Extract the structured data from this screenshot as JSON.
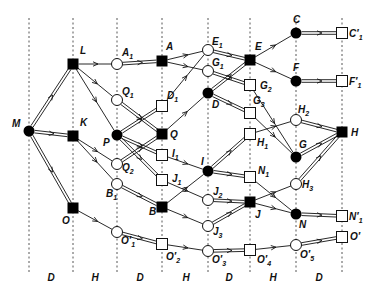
{
  "diagram": {
    "columns": [
      {
        "x": 29
      },
      {
        "x": 73
      },
      {
        "x": 117
      },
      {
        "x": 162
      },
      {
        "x": 208
      },
      {
        "x": 250
      },
      {
        "x": 296
      },
      {
        "x": 342
      }
    ],
    "bands": [
      {
        "label": "D",
        "x": 51
      },
      {
        "label": "H",
        "x": 95
      },
      {
        "label": "D",
        "x": 140
      },
      {
        "label": "H",
        "x": 186
      },
      {
        "label": "D",
        "x": 229
      },
      {
        "label": "H",
        "x": 273
      },
      {
        "label": "D",
        "x": 319
      }
    ],
    "nodes": [
      {
        "id": "M",
        "type": "filled-circle",
        "x": 29,
        "y": 131,
        "label": "M",
        "lx": 12,
        "ly": 127
      },
      {
        "id": "L",
        "type": "filled-square",
        "x": 73,
        "y": 64,
        "label": "L",
        "lx": 80,
        "ly": 54
      },
      {
        "id": "K",
        "type": "filled-square",
        "x": 73,
        "y": 136,
        "label": "K",
        "lx": 80,
        "ly": 126
      },
      {
        "id": "O",
        "type": "filled-square",
        "x": 73,
        "y": 208,
        "label": "O",
        "lx": 62,
        "ly": 224
      },
      {
        "id": "A1",
        "type": "open-circle",
        "x": 117,
        "y": 64,
        "label": "A",
        "sub": "1",
        "lx": 122,
        "ly": 56
      },
      {
        "id": "Q1",
        "type": "open-circle",
        "x": 117,
        "y": 100,
        "label": "Q",
        "sub": "1",
        "lx": 122,
        "ly": 95
      },
      {
        "id": "P",
        "type": "filled-circle",
        "x": 117,
        "y": 135,
        "label": "P",
        "lx": 103,
        "ly": 146
      },
      {
        "id": "Q2",
        "type": "open-circle",
        "x": 117,
        "y": 164,
        "label": "Q",
        "sub": "2",
        "lx": 122,
        "ly": 171
      },
      {
        "id": "B1",
        "type": "open-circle",
        "x": 117,
        "y": 184,
        "label": "B",
        "sub": "1",
        "lx": 106,
        "ly": 197
      },
      {
        "id": "O1p",
        "type": "open-circle",
        "x": 117,
        "y": 232,
        "label": "O′",
        "sub": "1",
        "lx": 121,
        "ly": 244
      },
      {
        "id": "A",
        "type": "filled-square",
        "x": 162,
        "y": 61,
        "label": "A",
        "lx": 166,
        "ly": 50
      },
      {
        "id": "D1",
        "type": "open-square",
        "x": 162,
        "y": 106,
        "label": "D",
        "sub": "1",
        "lx": 167,
        "ly": 99
      },
      {
        "id": "Q",
        "type": "filled-square",
        "x": 162,
        "y": 134,
        "label": "Q",
        "lx": 170,
        "ly": 138
      },
      {
        "id": "I1",
        "type": "open-square",
        "x": 162,
        "y": 155,
        "label": "I",
        "sub": "1",
        "lx": 172,
        "ly": 157
      },
      {
        "id": "J1",
        "type": "open-square",
        "x": 162,
        "y": 180,
        "label": "J",
        "sub": "1",
        "lx": 172,
        "ly": 182
      },
      {
        "id": "B",
        "type": "filled-square",
        "x": 162,
        "y": 207,
        "label": "B",
        "lx": 149,
        "ly": 215
      },
      {
        "id": "O2p",
        "type": "open-square",
        "x": 162,
        "y": 244,
        "label": "O′",
        "sub": "2",
        "lx": 166,
        "ly": 260
      },
      {
        "id": "E1",
        "type": "open-circle",
        "x": 208,
        "y": 50,
        "label": "E",
        "sub": "1",
        "lx": 212,
        "ly": 45
      },
      {
        "id": "G1",
        "type": "open-circle",
        "x": 208,
        "y": 71,
        "label": "G",
        "sub": "1",
        "lx": 212,
        "ly": 66
      },
      {
        "id": "D",
        "type": "filled-circle",
        "x": 208,
        "y": 93,
        "label": "D",
        "lx": 212,
        "ly": 108
      },
      {
        "id": "I",
        "type": "filled-circle",
        "x": 208,
        "y": 171,
        "label": "I",
        "lx": 201,
        "ly": 165
      },
      {
        "id": "J2",
        "type": "open-circle",
        "x": 208,
        "y": 200,
        "label": "J",
        "sub": "2",
        "lx": 213,
        "ly": 195
      },
      {
        "id": "J3",
        "type": "open-circle",
        "x": 208,
        "y": 226,
        "label": "J",
        "sub": "3",
        "lx": 213,
        "ly": 235
      },
      {
        "id": "O3p",
        "type": "open-circle",
        "x": 208,
        "y": 251,
        "label": "O′",
        "sub": "3",
        "lx": 212,
        "ly": 263
      },
      {
        "id": "E",
        "type": "filled-square",
        "x": 250,
        "y": 60,
        "label": "E",
        "lx": 255,
        "ly": 50
      },
      {
        "id": "G2",
        "type": "open-square",
        "x": 250,
        "y": 85,
        "label": "G",
        "sub": "2",
        "lx": 260,
        "ly": 89
      },
      {
        "id": "G3",
        "type": "open-square",
        "x": 250,
        "y": 113,
        "label": "G",
        "sub": "3",
        "lx": 253,
        "ly": 104
      },
      {
        "id": "H1",
        "type": "open-square",
        "x": 250,
        "y": 134,
        "label": "H",
        "sub": "1",
        "lx": 257,
        "ly": 146
      },
      {
        "id": "N1",
        "type": "open-square",
        "x": 250,
        "y": 177,
        "label": "N",
        "sub": "1",
        "lx": 258,
        "ly": 174
      },
      {
        "id": "J",
        "type": "filled-square",
        "x": 250,
        "y": 202,
        "label": "J",
        "lx": 255,
        "ly": 218
      },
      {
        "id": "O4p",
        "type": "open-square",
        "x": 250,
        "y": 250,
        "label": "O′",
        "sub": "4",
        "lx": 257,
        "ly": 263
      },
      {
        "id": "C",
        "type": "filled-circle",
        "x": 296,
        "y": 33,
        "label": "C",
        "lx": 293,
        "ly": 23
      },
      {
        "id": "F",
        "type": "filled-circle",
        "x": 296,
        "y": 81,
        "label": "F",
        "lx": 293,
        "ly": 71
      },
      {
        "id": "H2",
        "type": "open-circle",
        "x": 296,
        "y": 120,
        "label": "H",
        "sub": "2",
        "lx": 298,
        "ly": 113
      },
      {
        "id": "G",
        "type": "filled-circle",
        "x": 296,
        "y": 157,
        "label": "G",
        "lx": 299,
        "ly": 148
      },
      {
        "id": "H3",
        "type": "open-circle",
        "x": 296,
        "y": 184,
        "label": "H",
        "sub": "3",
        "lx": 302,
        "ly": 188
      },
      {
        "id": "N",
        "type": "filled-circle",
        "x": 296,
        "y": 214,
        "label": "N",
        "lx": 299,
        "ly": 228
      },
      {
        "id": "O5p",
        "type": "open-circle",
        "x": 296,
        "y": 245,
        "label": "O′",
        "sub": "5",
        "lx": 300,
        "ly": 258
      },
      {
        "id": "C1p",
        "type": "open-square",
        "x": 342,
        "y": 33,
        "label": "C′",
        "sub": "1",
        "lx": 349,
        "ly": 37
      },
      {
        "id": "F1p",
        "type": "open-square",
        "x": 342,
        "y": 81,
        "label": "F′",
        "sub": "1",
        "lx": 349,
        "ly": 85
      },
      {
        "id": "H",
        "type": "filled-square",
        "x": 342,
        "y": 132,
        "label": "H",
        "lx": 351,
        "ly": 136
      },
      {
        "id": "N1p",
        "type": "open-square",
        "x": 342,
        "y": 216,
        "label": "N′",
        "sub": "1",
        "lx": 349,
        "ly": 220
      },
      {
        "id": "Op",
        "type": "open-square",
        "x": 342,
        "y": 237,
        "label": "O′",
        "lx": 350,
        "ly": 240
      }
    ],
    "edges": [
      {
        "from": "M",
        "to": "L",
        "kind": "double"
      },
      {
        "from": "M",
        "to": "K",
        "kind": "double"
      },
      {
        "from": "M",
        "to": "O",
        "kind": "double"
      },
      {
        "from": "L",
        "to": "A1",
        "kind": "single"
      },
      {
        "from": "L",
        "to": "Q1",
        "kind": "single"
      },
      {
        "from": "L",
        "to": "P",
        "kind": "single"
      },
      {
        "from": "K",
        "to": "Q2",
        "kind": "single"
      },
      {
        "from": "K",
        "to": "B1",
        "kind": "single"
      },
      {
        "from": "O",
        "to": "O1p",
        "kind": "single"
      },
      {
        "from": "A1",
        "to": "A",
        "kind": "double"
      },
      {
        "from": "Q1",
        "to": "Q",
        "kind": "double"
      },
      {
        "from": "P",
        "to": "D1",
        "kind": "double"
      },
      {
        "from": "P",
        "to": "I1",
        "kind": "double"
      },
      {
        "from": "P",
        "to": "J1",
        "kind": "double"
      },
      {
        "from": "Q2",
        "to": "Q",
        "kind": "double"
      },
      {
        "from": "B1",
        "to": "B",
        "kind": "double"
      },
      {
        "from": "O1p",
        "to": "O2p",
        "kind": "double"
      },
      {
        "from": "A",
        "to": "E1",
        "kind": "single"
      },
      {
        "from": "A",
        "to": "G1",
        "kind": "single"
      },
      {
        "from": "D1",
        "to": "E1",
        "kind": "single"
      },
      {
        "from": "Q",
        "to": "D",
        "kind": "single"
      },
      {
        "from": "I1",
        "to": "I",
        "kind": "single"
      },
      {
        "from": "J1",
        "to": "J2",
        "kind": "single"
      },
      {
        "from": "B",
        "to": "I",
        "kind": "single"
      },
      {
        "from": "B",
        "to": "J3",
        "kind": "single"
      },
      {
        "from": "O2p",
        "to": "O3p",
        "kind": "single"
      },
      {
        "from": "E1",
        "to": "E",
        "kind": "double"
      },
      {
        "from": "G1",
        "to": "G2",
        "kind": "double"
      },
      {
        "from": "D",
        "to": "E",
        "kind": "double"
      },
      {
        "from": "D",
        "to": "G3",
        "kind": "double"
      },
      {
        "from": "I",
        "to": "H1",
        "kind": "double"
      },
      {
        "from": "I",
        "to": "N1",
        "kind": "double"
      },
      {
        "from": "J2",
        "to": "J",
        "kind": "double"
      },
      {
        "from": "J3",
        "to": "J",
        "kind": "double"
      },
      {
        "from": "O3p",
        "to": "O4p",
        "kind": "double"
      },
      {
        "from": "E",
        "to": "C",
        "kind": "single"
      },
      {
        "from": "E",
        "to": "F",
        "kind": "single"
      },
      {
        "from": "G2",
        "to": "G",
        "kind": "single"
      },
      {
        "from": "G3",
        "to": "G",
        "kind": "single"
      },
      {
        "from": "H1",
        "to": "H2",
        "kind": "single"
      },
      {
        "from": "N1",
        "to": "N",
        "kind": "single"
      },
      {
        "from": "J",
        "to": "H3",
        "kind": "single"
      },
      {
        "from": "J",
        "to": "N",
        "kind": "single"
      },
      {
        "from": "O4p",
        "to": "O5p",
        "kind": "single"
      },
      {
        "from": "C",
        "to": "C1p",
        "kind": "double"
      },
      {
        "from": "F",
        "to": "F1p",
        "kind": "double"
      },
      {
        "from": "H2",
        "to": "H",
        "kind": "double"
      },
      {
        "from": "G",
        "to": "H",
        "kind": "double"
      },
      {
        "from": "H3",
        "to": "H",
        "kind": "double"
      },
      {
        "from": "N",
        "to": "N1p",
        "kind": "double"
      },
      {
        "from": "O5p",
        "to": "Op",
        "kind": "double"
      }
    ]
  }
}
